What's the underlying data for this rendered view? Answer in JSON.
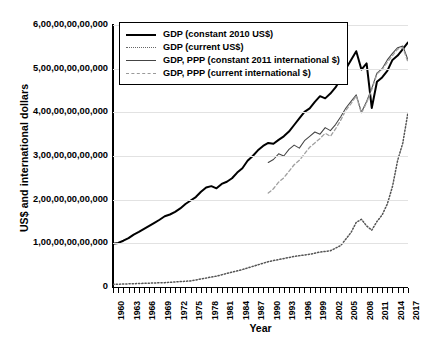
{
  "chart_data": {
    "type": "line",
    "title": "",
    "xlabel": "Year",
    "ylabel": "US$ and international dollars",
    "xlim": [
      1960,
      2017
    ],
    "ylim": [
      0,
      600000000000
    ],
    "grid": true,
    "legend_position": "top-left",
    "ytick_labels": [
      "0",
      "1,00,00,00,00,000",
      "2,00,00,00,00,000",
      "3,00,00,00,00,000",
      "4,00,00,00,00,000",
      "5,00,00,00,00,000",
      "6,00,00,00,00,000"
    ],
    "ytick_values": [
      0,
      100000000000,
      200000000000,
      300000000000,
      400000000000,
      500000000000,
      600000000000
    ],
    "xtick_labels": [
      "1960",
      "1963",
      "1966",
      "1969",
      "1972",
      "1975",
      "1978",
      "1981",
      "1984",
      "1987",
      "1990",
      "1993",
      "1996",
      "1999",
      "2002",
      "2005",
      "2008",
      "2011",
      "2014",
      "2017"
    ],
    "xtick_values": [
      1960,
      1963,
      1966,
      1969,
      1972,
      1975,
      1978,
      1981,
      1984,
      1987,
      1990,
      1993,
      1996,
      1999,
      2002,
      2005,
      2008,
      2011,
      2014,
      2017
    ],
    "series": [
      {
        "name": "GDP (constant 2010 US$)",
        "style": "solid-thick",
        "color": "#000000",
        "x": [
          1960,
          1961,
          1962,
          1963,
          1964,
          1965,
          1966,
          1967,
          1968,
          1969,
          1970,
          1971,
          1972,
          1973,
          1974,
          1975,
          1976,
          1977,
          1978,
          1979,
          1980,
          1981,
          1982,
          1983,
          1984,
          1985,
          1986,
          1987,
          1988,
          1989,
          1990,
          1991,
          1992,
          1993,
          1994,
          1995,
          1996,
          1997,
          1998,
          1999,
          2000,
          2001,
          2002,
          2003,
          2004,
          2005,
          2006,
          2007,
          2008,
          2009,
          2010,
          2011,
          2012,
          2013,
          2014,
          2015,
          2016,
          2017
        ],
        "values": [
          99,
          101,
          106,
          112,
          120,
          126,
          133,
          140,
          147,
          154,
          162,
          166,
          172,
          180,
          190,
          198,
          206,
          218,
          228,
          231,
          226,
          236,
          241,
          249,
          262,
          272,
          289,
          300,
          313,
          323,
          330,
          328,
          337,
          345,
          356,
          371,
          386,
          401,
          409,
          424,
          437,
          432,
          443,
          457,
          477,
          500,
          520,
          540,
          498,
          512,
          410,
          470,
          480,
          495,
          520,
          530,
          545,
          560
        ]
      },
      {
        "name": "GDP (current US$)",
        "style": "dotted",
        "color": "#555555",
        "x": [
          1960,
          1965,
          1970,
          1975,
          1980,
          1985,
          1990,
          1995,
          1998,
          2000,
          2002,
          2004,
          2005,
          2006,
          2007,
          2008,
          2009,
          2010,
          2011,
          2012,
          2013,
          2014,
          2015,
          2016,
          2017
        ],
        "values": [
          6,
          8,
          10,
          14,
          25,
          40,
          58,
          70,
          75,
          80,
          83,
          95,
          110,
          125,
          148,
          155,
          140,
          130,
          150,
          165,
          190,
          230,
          290,
          330,
          400
        ]
      },
      {
        "name": "GDP, PPP (constant 2011 international $)",
        "style": "solid-thin",
        "color": "#444444",
        "x": [
          1990,
          1991,
          1992,
          1993,
          1994,
          1995,
          1996,
          1997,
          1998,
          1999,
          2000,
          2001,
          2002,
          2003,
          2004,
          2005,
          2006,
          2007,
          2008,
          2009,
          2010,
          2011,
          2012,
          2013,
          2014,
          2015,
          2016,
          2017
        ],
        "values": [
          285,
          292,
          305,
          300,
          315,
          325,
          318,
          335,
          345,
          355,
          350,
          365,
          358,
          372,
          390,
          410,
          425,
          440,
          400,
          425,
          455,
          490,
          500,
          520,
          535,
          548,
          552,
          520
        ]
      },
      {
        "name": "GDP, PPP (current international $)",
        "style": "dashed",
        "color": "#a0a0a0",
        "x": [
          1990,
          1991,
          1992,
          1993,
          1994,
          1995,
          1996,
          1997,
          1998,
          1999,
          2000,
          2001,
          2002,
          2003,
          2004,
          2005,
          2006,
          2007,
          2008,
          2009,
          2010,
          2011,
          2012,
          2013,
          2014,
          2015,
          2016,
          2017
        ],
        "values": [
          215,
          225,
          240,
          250,
          265,
          280,
          290,
          305,
          320,
          330,
          340,
          352,
          345,
          362,
          382,
          405,
          420,
          438,
          398,
          422,
          452,
          488,
          498,
          515,
          530,
          545,
          548,
          515
        ]
      }
    ]
  },
  "legend": {
    "items": [
      {
        "label": "GDP (constant 2010 US$)",
        "swatch": "sw-solid-thick"
      },
      {
        "label": "GDP (current US$)",
        "swatch": "sw-dotted"
      },
      {
        "label": "GDP, PPP (constant 2011 international $)",
        "swatch": "sw-solid-thin"
      },
      {
        "label": "GDP, PPP (current international $)",
        "swatch": "sw-dashed"
      }
    ]
  }
}
